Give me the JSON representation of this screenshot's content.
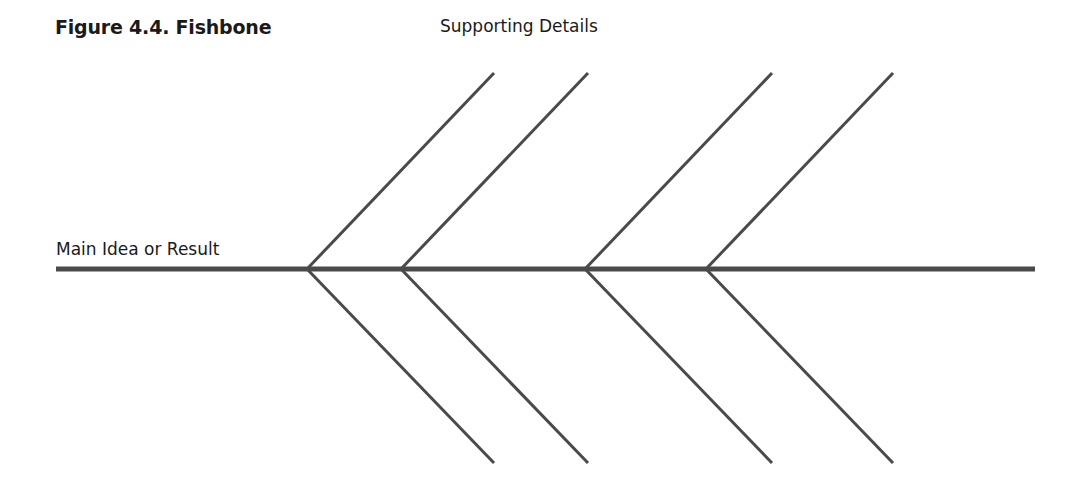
{
  "figure": {
    "title": "Figure 4.4. Fishbone",
    "supporting_label": "Supporting Details",
    "main_label": "Main Idea or Result"
  },
  "colors": {
    "line": "#4a4a4a",
    "text": "#1a1a1a",
    "background": "#ffffff"
  },
  "diagram": {
    "spine": {
      "x1": 56,
      "y1": 269,
      "x2": 1035,
      "y2": 269,
      "width": 5
    },
    "ribs": [
      {
        "vx": 307,
        "ex": 494
      },
      {
        "vx": 401,
        "ex": 588
      },
      {
        "vx": 585,
        "ex": 772
      },
      {
        "vx": 706,
        "ex": 893
      }
    ],
    "rib_top_y": 73,
    "rib_bottom_y": 463,
    "rib_width": 3
  }
}
